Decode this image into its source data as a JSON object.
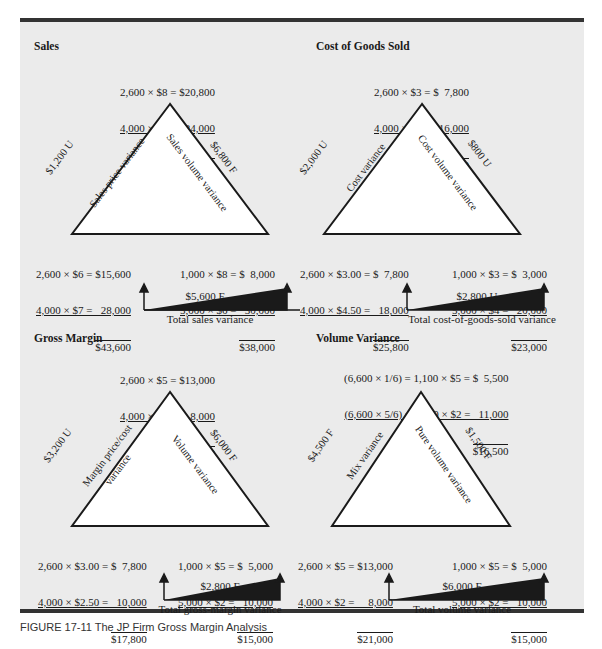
{
  "figure_caption": "FIGURE 17-11  The JP Firm Gross Margin Analysis",
  "panels": [
    {
      "title": "Sales",
      "top_calc": [
        "2,600 × $8 = $20,800",
        "4,000 × $6 =   24,000",
        "$44,800"
      ],
      "left_side_amount": "$1,200 U",
      "left_side_label": "Sales price variance",
      "right_side_amount": "$6,800 F",
      "right_side_label": "Sales volume variance",
      "bottom_left_calc": [
        "2,600 × $6 = $15,600",
        "4,000 × $7 =   28,000",
        "$43,600"
      ],
      "bottom_right_calc": [
        "1,000 × $8 = $  8,000",
        "5,000 × $6 =   30,000",
        "$38,000"
      ],
      "total_value": "$5,600 F",
      "total_label": "Total sales variance"
    },
    {
      "title": "Cost of Goods Sold",
      "top_calc": [
        "2,600 × $3 = $  7,800",
        "4,000 × $4 =   16,000",
        "$23,800"
      ],
      "left_side_amount": "$2,000 U",
      "left_side_label": "Cost variance",
      "right_side_amount": "$800 U",
      "right_side_label": "Cost volume variance",
      "bottom_left_calc": [
        "2,600 × $3.00 = $  7,800",
        "4,000 × $4.50 =   18,000",
        "$25,800"
      ],
      "bottom_right_calc": [
        "1,000 × $3 = $  3,000",
        "5,000 × $4 =   20,000",
        "$23,000"
      ],
      "total_value": "$2,800 U",
      "total_label": "Total cost-of-goods-sold variance"
    },
    {
      "title": "Gross Margin",
      "top_calc": [
        "2,600 × $5 = $13,000",
        "4,000 × $2 =     8,000",
        "$21,000"
      ],
      "left_side_amount": "$3,200 U",
      "left_side_label": "Margin price/cost",
      "left_side_label2": "variance",
      "right_side_amount": "$6,000 F",
      "right_side_label": "Volume variance",
      "bottom_left_calc": [
        "2,600 × $3.00 = $  7,800",
        "4,000 × $2.50 =   10,000",
        "$17,800"
      ],
      "bottom_right_calc": [
        "1,000 × $5 = $  5,000",
        "5,000 × $2 =   10,000",
        "$15,000"
      ],
      "total_value": "$2,800 F",
      "total_label": "Total gross-margin variance"
    },
    {
      "title": "Volume Variance",
      "top_calc": [
        "(6,600 × 1/6) = 1,100 × $5 = $  5,500",
        "(6,600 × 5/6) = 5,500 × $2 =   11,000",
        "$16,500"
      ],
      "left_side_amount": "$4,500 F",
      "left_side_label": "Mix variance",
      "right_side_amount": "$1,500 F",
      "right_side_label": "Pure volume variance",
      "bottom_left_calc": [
        "2,600 × $5 = $13,000",
        "4,000 × $2 =     8,000",
        "$21,000"
      ],
      "bottom_right_calc": [
        "1,000 × $5 = $  5,000",
        "5,000 × $2 =   10,000",
        "$15,000"
      ],
      "total_value": "$6,000 F",
      "total_label": "Total volume variance"
    }
  ]
}
